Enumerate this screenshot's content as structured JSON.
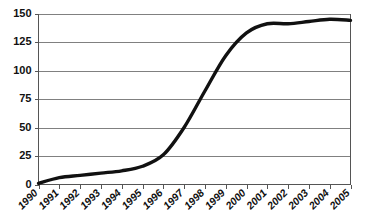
{
  "chart_data": {
    "type": "line",
    "title": "",
    "subtitle": "",
    "xlabel": "",
    "ylabel": "",
    "categories": [
      "1990",
      "1991",
      "1992",
      "1993",
      "1994",
      "1995",
      "1996",
      "1997",
      "1998",
      "1999",
      "2000",
      "2001",
      "2002",
      "2003",
      "2004",
      "2005"
    ],
    "values": [
      1,
      6,
      8,
      10,
      12,
      16,
      26,
      50,
      82,
      113,
      133,
      141,
      141,
      143,
      145,
      144
    ],
    "series": [
      {
        "name": "series-1",
        "values": [
          1,
          6,
          8,
          10,
          12,
          16,
          26,
          50,
          82,
          113,
          133,
          141,
          141,
          143,
          145,
          144
        ]
      }
    ],
    "xlim": [
      1990,
      2005
    ],
    "ylim": [
      0,
      150
    ],
    "y_ticks": [
      0,
      25,
      50,
      75,
      100,
      125,
      150
    ],
    "y_tick_labels": [
      "0",
      "25",
      "50",
      "75",
      "100",
      "125",
      "150"
    ],
    "x_tick_labels": [
      "1990",
      "1991",
      "1992",
      "1993",
      "1994",
      "1995",
      "1996",
      "1997",
      "1998",
      "1999",
      "2000",
      "2001",
      "2002",
      "2003",
      "2004",
      "2005"
    ],
    "grid": "horizontal",
    "legend": "none",
    "annotations": [],
    "colors": {
      "line": "#111111",
      "gridline": "#808080",
      "axis": "#555555",
      "background": "#ffffff",
      "text": "#111111"
    }
  },
  "axes": {
    "y_labels": [
      "150",
      "125",
      "100",
      "75",
      "50",
      "25",
      "0"
    ],
    "x_labels": [
      "1990",
      "1991",
      "1992",
      "1993",
      "1994",
      "1995",
      "1996",
      "1997",
      "1998",
      "1999",
      "2000",
      "2001",
      "2002",
      "2003",
      "2004",
      "2005"
    ]
  }
}
